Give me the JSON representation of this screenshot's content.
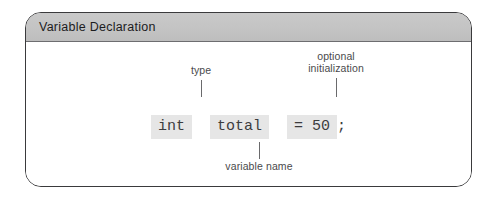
{
  "figure": {
    "title": "Variable Declaration",
    "code": {
      "type_token": "int",
      "name_token": "total",
      "init_token": "= 50",
      "terminator": ";"
    },
    "annotations": {
      "type_label": "type",
      "optional_initialization_label": "optional\ninitialization",
      "variable_name_label": "variable name"
    },
    "colors": {
      "panel_border": "#3a3a3c",
      "title_bar": "#c3c3c3",
      "code_highlight": "#e6e6e6",
      "code_text": "#3c3c3e",
      "annotation_text": "#4a4a4c",
      "canvas": "#ffffff"
    }
  }
}
